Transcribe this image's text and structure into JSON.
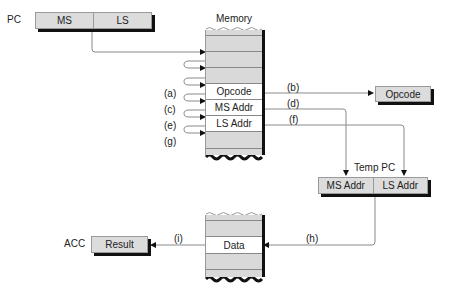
{
  "pc": {
    "label": "PC",
    "cells": [
      "MS",
      "LS"
    ]
  },
  "memory": {
    "title": "Memory",
    "rows": [
      "",
      "",
      "",
      "Opcode",
      "MS Addr",
      "LS Addr",
      ""
    ]
  },
  "step_labels": {
    "a": "(a)",
    "b": "(b)",
    "c": "(c)",
    "d": "(d)",
    "e": "(e)",
    "f": "(f)",
    "g": "(g)",
    "h": "(h)",
    "i": "(i)"
  },
  "opcode_register": {
    "label": "Opcode"
  },
  "temp_pc": {
    "label": "Temp PC",
    "cells": [
      "MS Addr",
      "LS Addr"
    ]
  },
  "data_memory": {
    "rows": [
      "",
      "Data",
      ""
    ]
  },
  "acc": {
    "label": "ACC",
    "value": "Result"
  },
  "colors": {
    "cell_fill": "#dcdcdc",
    "shadow": "#111111",
    "line": "#888888"
  }
}
